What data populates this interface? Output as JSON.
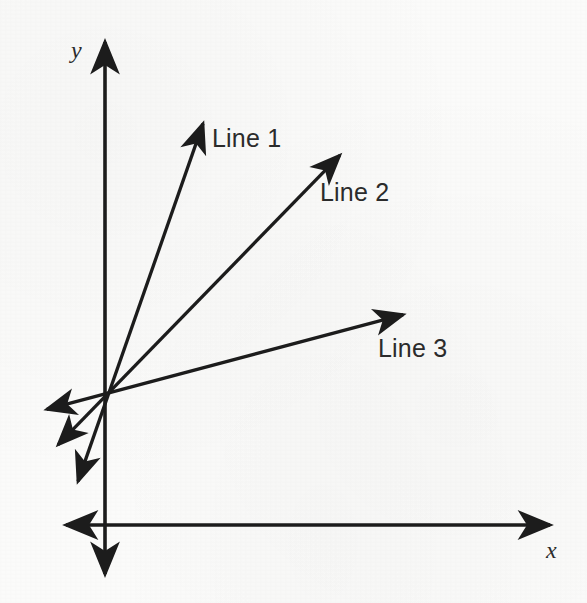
{
  "figure": {
    "title": "",
    "background_color": "#fbfbfa",
    "stroke_color": "#1c1c1c",
    "text_color": "#2b2b2b"
  },
  "axes": {
    "x_label": "x",
    "y_label": "y",
    "origin": {
      "x": 105,
      "y": 395
    },
    "x_axis": {
      "left_tip": {
        "x": 60,
        "y": 525
      },
      "right_tip": {
        "x": 556,
        "y": 525
      },
      "y_position": 525,
      "double_headed": true
    },
    "y_axis": {
      "top_tip": {
        "x": 105,
        "y": 36
      },
      "bottom_tip": {
        "x": 105,
        "y": 580
      },
      "x_position": 105,
      "double_headed": true
    }
  },
  "chart_data": {
    "type": "line",
    "title": "",
    "xlabel": "x",
    "ylabel": "y",
    "grid": false,
    "legend": "inline-annotations",
    "origin": {
      "x": 105,
      "y": 395
    },
    "series": [
      {
        "name": "Line 1",
        "label": "Line 1",
        "slope_rank": "steepest",
        "positive_end": {
          "x": 205,
          "y": 118
        },
        "negative_end": {
          "x": 76,
          "y": 487
        },
        "label_position": {
          "x": 212,
          "y": 126
        }
      },
      {
        "name": "Line 2",
        "label": "Line 2",
        "slope_rank": "intermediate",
        "positive_end": {
          "x": 344,
          "y": 151
        },
        "negative_end": {
          "x": 54,
          "y": 449
        },
        "label_position": {
          "x": 320,
          "y": 180
        }
      },
      {
        "name": "Line 3",
        "label": "Line 3",
        "slope_rank": "shallowest",
        "positive_end": {
          "x": 409,
          "y": 313
        },
        "negative_end": {
          "x": 41,
          "y": 411
        },
        "label_position": {
          "x": 378,
          "y": 336
        }
      }
    ]
  }
}
